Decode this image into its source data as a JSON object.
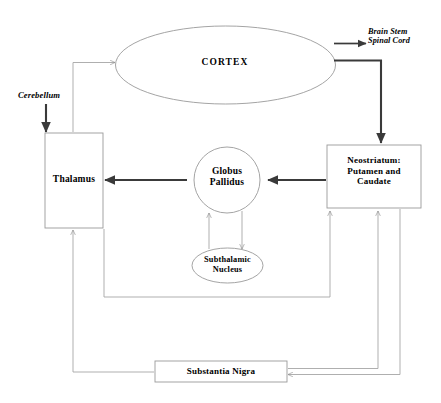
{
  "diagram": {
    "nodes": {
      "cortex": {
        "label": "CORTEX",
        "shape": "ellipse"
      },
      "thalamus": {
        "label": "Thalamus",
        "shape": "rectangle"
      },
      "globus_pallidus": {
        "label_line1": "Globus",
        "label_line2": "Pallidus",
        "shape": "circle"
      },
      "subthalamic_nucleus": {
        "label_line1": "Subthalamic",
        "label_line2": "Nucleus",
        "shape": "ellipse"
      },
      "neostriatum": {
        "label_line1": "Neostriatum:",
        "label_line2": "Putamen and",
        "label_line3": "Caudate",
        "shape": "rectangle"
      },
      "substantia_nigra": {
        "label": "Substantia Nigra",
        "shape": "rectangle"
      }
    },
    "external_labels": {
      "cerebellum": "Cerebellum",
      "brain_stem_line1": "Brain Stem",
      "brain_stem_line2": "Spinal Cord"
    },
    "colors": {
      "background": "#ffffff",
      "stroke_thin": "#8e8e8e",
      "stroke_thick": "#3a3a3a",
      "text": "#000000"
    }
  }
}
